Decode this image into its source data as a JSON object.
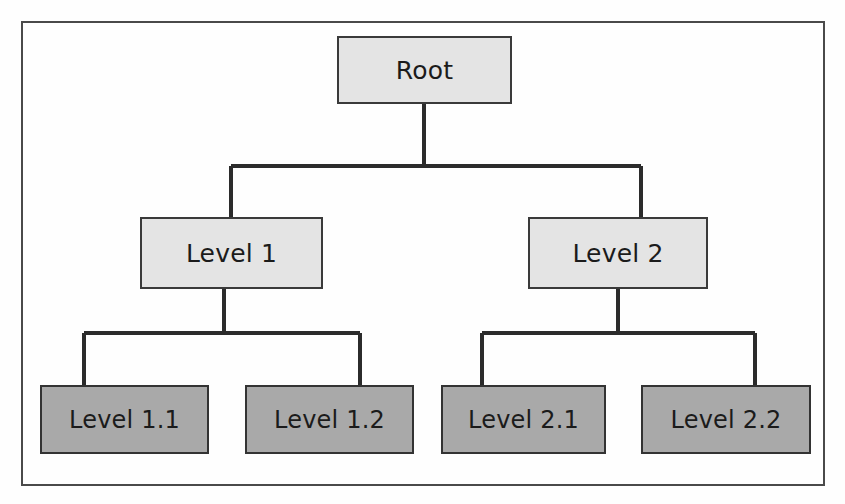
{
  "diagram": {
    "type": "tree",
    "frame": {
      "border_color": "#4a4a4a",
      "background": "#ffffff"
    },
    "palette": {
      "level_0_fill": "#e4e4e4",
      "level_1_fill": "#e4e4e4",
      "level_2_fill": "#a9a9a9",
      "box_stroke": "#3a3a3a",
      "connector_stroke": "#2b2b2b",
      "text_color": "#1b1b1b"
    },
    "nodes": [
      {
        "id": "root",
        "label": "Root",
        "depth": 0,
        "parent": null,
        "fill": "light"
      },
      {
        "id": "level-1",
        "label": "Level 1",
        "depth": 1,
        "parent": "root",
        "fill": "light"
      },
      {
        "id": "level-2",
        "label": "Level 2",
        "depth": 1,
        "parent": "root",
        "fill": "light"
      },
      {
        "id": "level-1-1",
        "label": "Level 1.1",
        "depth": 2,
        "parent": "level-1",
        "fill": "dark"
      },
      {
        "id": "level-1-2",
        "label": "Level 1.2",
        "depth": 2,
        "parent": "level-1",
        "fill": "dark"
      },
      {
        "id": "level-2-1",
        "label": "Level 2.1",
        "depth": 2,
        "parent": "level-2",
        "fill": "dark"
      },
      {
        "id": "level-2-2",
        "label": "Level 2.2",
        "depth": 2,
        "parent": "level-2",
        "fill": "dark"
      }
    ],
    "edges": [
      {
        "from": "root",
        "to": "level-1"
      },
      {
        "from": "root",
        "to": "level-2"
      },
      {
        "from": "level-1",
        "to": "level-1-1"
      },
      {
        "from": "level-1",
        "to": "level-1-2"
      },
      {
        "from": "level-2",
        "to": "level-2-1"
      },
      {
        "from": "level-2",
        "to": "level-2-2"
      }
    ]
  }
}
